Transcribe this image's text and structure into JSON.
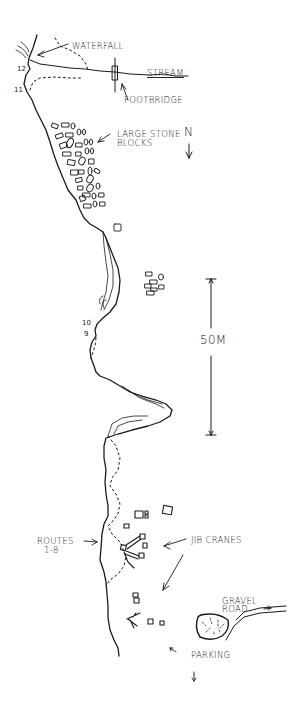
{
  "map": {
    "title": "",
    "style": "hand-drawn sketch",
    "ink_color": "#1a1a1a",
    "background": "#ffffff",
    "labels": {
      "waterfall": "WATERFALL",
      "stream": "STREAM",
      "footbridge": "FOOTBRIDGE",
      "large_stone_blocks_1": "LARGE STONE",
      "large_stone_blocks_2": "BLOCKS",
      "north": "N",
      "scale": "50M",
      "routes_1": "ROUTES",
      "routes_2": "1-8",
      "jib_cranes": "JIB CRANES",
      "gravel_road_1": "GRAVEL",
      "gravel_road_2": "ROAD",
      "parking": "PARKING"
    },
    "route_numbers": [
      "12",
      "11",
      "10",
      "9"
    ],
    "scale_bar": {
      "length_label": "50M"
    },
    "north_arrow": {
      "label": "N",
      "direction": "down"
    }
  }
}
